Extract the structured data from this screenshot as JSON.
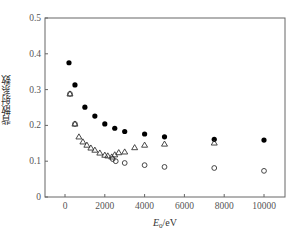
{
  "chart_data": {
    "type": "scatter",
    "title": "",
    "xlabel": "E0/eV",
    "xlabel_main": "E",
    "xlabel_sub": "0",
    "xlabel_unit": "/eV",
    "ylabel": "背散射系数",
    "xlim": [
      -1000,
      11000
    ],
    "ylim": [
      0,
      0.5
    ],
    "xticks": [
      0,
      2000,
      4000,
      6000,
      8000,
      10000
    ],
    "xtick_labels": [
      "0",
      "2000",
      "4000",
      "6000",
      "8000",
      "10000"
    ],
    "yticks": [
      0,
      0.1,
      0.2,
      0.3,
      0.4,
      0.5
    ],
    "ytick_labels": [
      "0",
      "0.1",
      "0.2",
      "0.3",
      "0.4",
      "0.5"
    ],
    "grid": false,
    "legend": null,
    "series": [
      {
        "name": "filled circles",
        "marker": "filled-circle",
        "color": "#000000",
        "x": [
          200,
          500,
          1000,
          1500,
          2000,
          2500,
          3000,
          4000,
          5000,
          7500,
          10000
        ],
        "y": [
          0.375,
          0.313,
          0.251,
          0.226,
          0.204,
          0.192,
          0.183,
          0.176,
          0.168,
          0.161,
          0.159
        ]
      },
      {
        "name": "open triangles",
        "marker": "open-triangle",
        "color": "#000000",
        "x": [
          250,
          500,
          700,
          900,
          1100,
          1300,
          1500,
          1750,
          2000,
          2150,
          2350,
          2500,
          2700,
          3000,
          3500,
          4000,
          5000,
          7500
        ],
        "y": [
          0.288,
          0.204,
          0.168,
          0.154,
          0.145,
          0.137,
          0.131,
          0.123,
          0.117,
          0.115,
          0.112,
          0.118,
          0.124,
          0.126,
          0.138,
          0.145,
          0.148,
          0.151
        ]
      },
      {
        "name": "open circles",
        "marker": "open-circle",
        "color": "#000000",
        "x": [
          250,
          500,
          2400,
          2550,
          3000,
          4000,
          5000,
          7500,
          10000
        ],
        "y": [
          0.288,
          0.204,
          0.106,
          0.1,
          0.095,
          0.089,
          0.084,
          0.081,
          0.073
        ]
      }
    ]
  }
}
